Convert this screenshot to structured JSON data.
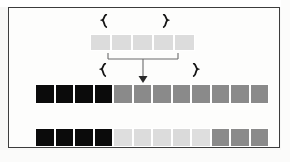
{
  "figure": {
    "kind": "array-splice-diagram",
    "background_color": "#f7f7f6",
    "frame_color": "#3c3c3c",
    "cell_border_color": "#ffffff"
  },
  "rows": {
    "source": {
      "name": "source-array",
      "cell_count": 5,
      "cells": [
        {
          "index": 0,
          "color": "#dcdcdc",
          "label": ""
        },
        {
          "index": 1,
          "color": "#dcdcdc",
          "label": ""
        },
        {
          "index": 2,
          "color": "#dcdcdc",
          "label": ""
        },
        {
          "index": 3,
          "color": "#dcdcdc",
          "label": ""
        },
        {
          "index": 4,
          "color": "#dcdcdc",
          "label": ""
        }
      ]
    },
    "target": {
      "name": "target-array",
      "cell_count": 12,
      "cells": [
        {
          "index": 0,
          "color": "#0b0b0b",
          "label": ""
        },
        {
          "index": 1,
          "color": "#0b0b0b",
          "label": ""
        },
        {
          "index": 2,
          "color": "#0b0b0b",
          "label": ""
        },
        {
          "index": 3,
          "color": "#0b0b0b",
          "label": ""
        },
        {
          "index": 4,
          "color": "#8a8a8a",
          "label": ""
        },
        {
          "index": 5,
          "color": "#8a8a8a",
          "label": ""
        },
        {
          "index": 6,
          "color": "#8a8a8a",
          "label": ""
        },
        {
          "index": 7,
          "color": "#8a8a8a",
          "label": ""
        },
        {
          "index": 8,
          "color": "#8a8a8a",
          "label": ""
        },
        {
          "index": 9,
          "color": "#8a8a8a",
          "label": ""
        },
        {
          "index": 10,
          "color": "#8a8a8a",
          "label": ""
        },
        {
          "index": 11,
          "color": "#8a8a8a",
          "label": ""
        }
      ]
    },
    "result": {
      "name": "result-array",
      "cell_count": 12,
      "cells": [
        {
          "index": 0,
          "color": "#0b0b0b",
          "label": ""
        },
        {
          "index": 1,
          "color": "#0b0b0b",
          "label": ""
        },
        {
          "index": 2,
          "color": "#0b0b0b",
          "label": ""
        },
        {
          "index": 3,
          "color": "#0b0b0b",
          "label": ""
        },
        {
          "index": 4,
          "color": "#dedede",
          "label": ""
        },
        {
          "index": 5,
          "color": "#dcdcdc",
          "label": ""
        },
        {
          "index": 6,
          "color": "#dcdcdc",
          "label": ""
        },
        {
          "index": 7,
          "color": "#dadada",
          "label": ""
        },
        {
          "index": 8,
          "color": "#dedede",
          "label": ""
        },
        {
          "index": 9,
          "color": "#8a8a8a",
          "label": ""
        },
        {
          "index": 10,
          "color": "#8a8a8a",
          "label": ""
        },
        {
          "index": 11,
          "color": "#8a8a8a",
          "label": ""
        }
      ]
    }
  },
  "markers": {
    "glyph_left": "❴",
    "glyph_right": "❵",
    "color": "#151515",
    "items": [
      {
        "id": "source-span-start",
        "row": "source",
        "side": "left",
        "x": 99,
        "y": 13
      },
      {
        "id": "source-span-end",
        "row": "source",
        "side": "right",
        "x": 160,
        "y": 13
      },
      {
        "id": "target-span-start",
        "row": "target",
        "side": "left",
        "x": 98,
        "y": 62
      },
      {
        "id": "target-span-end",
        "row": "target",
        "side": "right",
        "x": 190,
        "y": 62
      }
    ]
  },
  "connector": {
    "name": "splice-connector",
    "stroke_color": "#5a5a5a",
    "arrow_color": "#2a2a2a",
    "bracket_left_x": 0,
    "bracket_right_x": 71,
    "bracket_y": 2,
    "drop_x": 36,
    "drop_y_end": 30,
    "arrow_target_row": "target",
    "arrow_target_cell_index": 4
  }
}
